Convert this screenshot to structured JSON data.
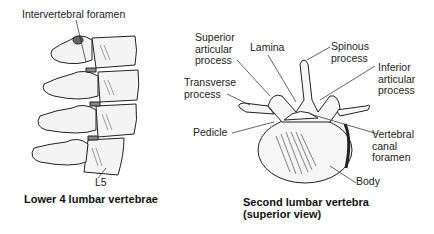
{
  "left_figure": {
    "caption": "Lower 4 lumbar vertebrae",
    "labels": {
      "intervertebral_foramen": "Intervertebral foramen",
      "l5": "L5"
    }
  },
  "right_figure": {
    "caption_line1": "Second lumbar vertebra",
    "caption_line2": "(superior view)",
    "labels": {
      "superior_articular_process": "Superior\narticular\nprocess",
      "lamina": "Lamina",
      "spinous_process": "Spinous\nprocess",
      "inferior_articular_process": "Inferior\narticular\nprocess",
      "transverse_process": "Transverse\nprocess",
      "pedicle": "Pedicle",
      "vertebral_canal_foramen": "Vertebral\ncanal\nforamen",
      "body": "Body"
    }
  }
}
